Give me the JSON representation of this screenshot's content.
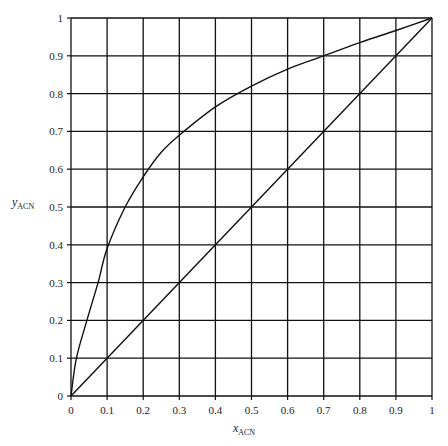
{
  "chart_data": {
    "type": "line",
    "title": "",
    "xlabel": "x_ACN",
    "xlabel_main": "x",
    "xlabel_sub": "ACN",
    "ylabel": "y_ACN",
    "ylabel_main": "y",
    "ylabel_sub": "ACN",
    "xlim": [
      0,
      1
    ],
    "ylim": [
      0,
      1
    ],
    "grid": true,
    "legend": null,
    "x_ticks": [
      "0",
      "0.1",
      "0.2",
      "0.3",
      "0.4",
      "0.5",
      "0.6",
      "0.7",
      "0.8",
      "0.9",
      "1"
    ],
    "y_ticks": [
      "0",
      "0.1",
      "0.2",
      "0.3",
      "0.4",
      "0.5",
      "0.6",
      "0.7",
      "0.8",
      "0.9",
      "1"
    ],
    "series": [
      {
        "name": "equilibrium curve",
        "x": [
          0,
          0.015,
          0.044,
          0.075,
          0.1,
          0.15,
          0.2,
          0.25,
          0.3,
          0.4,
          0.5,
          0.6,
          0.7,
          0.8,
          0.9,
          1.0
        ],
        "y": [
          0,
          0.1,
          0.2,
          0.3,
          0.39,
          0.5,
          0.58,
          0.645,
          0.69,
          0.765,
          0.82,
          0.865,
          0.9,
          0.935,
          0.967,
          1.0
        ]
      },
      {
        "name": "diagonal y=x",
        "x": [
          0,
          1
        ],
        "y": [
          0,
          1
        ]
      }
    ],
    "colors": {
      "line": "#111111",
      "grid": "#111111",
      "background": "#ffffff"
    }
  }
}
